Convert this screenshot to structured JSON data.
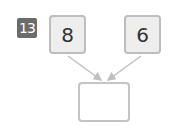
{
  "problem": {
    "number": "13",
    "left_value": "8",
    "right_value": "6",
    "answer": ""
  },
  "colors": {
    "badge": "#6b6b6b",
    "box_fill": "#eeeeee",
    "box_border": "#bdbdbd",
    "arrow": "#c0c0c0"
  }
}
